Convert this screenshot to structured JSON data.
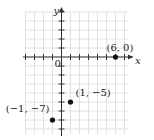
{
  "chart_data": {
    "type": "scatter",
    "title": "",
    "xlabel": "x",
    "ylabel": "y",
    "origin_label": "0",
    "xlim": [
      -4,
      7
    ],
    "ylim": [
      -8,
      5
    ],
    "grid": true,
    "points": [
      {
        "x": 6,
        "y": 0,
        "label": "(6, 0)"
      },
      {
        "x": 1,
        "y": -5,
        "label": "(1, −5)"
      },
      {
        "x": -1,
        "y": -7,
        "label": "(−1, −7)"
      }
    ]
  },
  "colors": {
    "grid": "#d9d9d9",
    "axis": "#333333",
    "point": "#111111",
    "text": "#222222"
  }
}
